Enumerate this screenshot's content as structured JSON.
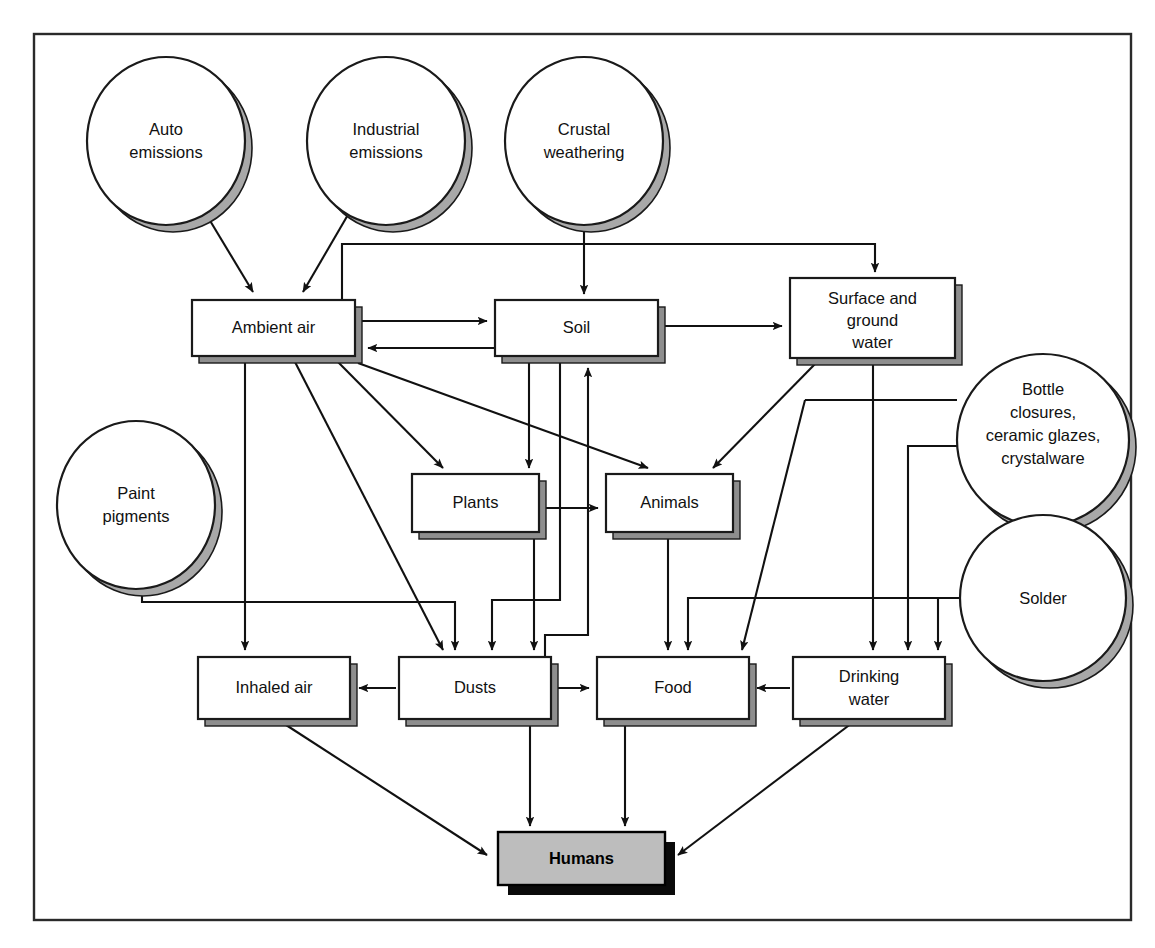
{
  "figure": {
    "frame": {
      "x": 33,
      "y": 33,
      "width": 1099,
      "height": 888
    }
  },
  "colors": {
    "line": "#111111",
    "box_fill": "#ffffff",
    "box_shadow": "#8e8e8e",
    "circle_shadow": "#a8a8a8",
    "humans_fill": "#bdbdbd",
    "humans_shadow": "#0a0a0a",
    "frame": "#2a2a2a"
  },
  "sources": [
    {
      "id": "auto-emissions",
      "lines": [
        "Auto",
        "emissions"
      ],
      "cx": 166,
      "cy": 141,
      "rx": 79,
      "ry": 84
    },
    {
      "id": "industrial-emissions",
      "lines": [
        "Industrial",
        "emissions"
      ],
      "cx": 386,
      "cy": 141,
      "rx": 79,
      "ry": 84
    },
    {
      "id": "crustal-weathering",
      "lines": [
        "Crustal",
        "weathering"
      ],
      "cx": 584,
      "cy": 141,
      "rx": 79,
      "ry": 84
    },
    {
      "id": "paint-pigments",
      "lines": [
        "Paint",
        "pigments"
      ],
      "cx": 136,
      "cy": 505,
      "rx": 79,
      "ry": 84
    },
    {
      "id": "bottle-closures",
      "lines": [
        "Bottle",
        "closures,",
        "ceramic glazes,",
        "crystalware"
      ],
      "cx": 1043,
      "cy": 440,
      "rx": 86,
      "ry": 86
    },
    {
      "id": "solder",
      "lines": [
        "Solder"
      ],
      "cx": 1043,
      "cy": 598,
      "rx": 83,
      "ry": 83
    }
  ],
  "compartments": [
    {
      "id": "ambient-air",
      "lines": [
        "Ambient air"
      ],
      "x": 192,
      "y": 300,
      "w": 163,
      "h": 56
    },
    {
      "id": "soil",
      "lines": [
        "Soil"
      ],
      "x": 495,
      "y": 300,
      "w": 163,
      "h": 56
    },
    {
      "id": "surface-ground-water",
      "lines": [
        "Surface and",
        "ground",
        "water"
      ],
      "x": 790,
      "y": 278,
      "w": 165,
      "h": 80
    },
    {
      "id": "plants",
      "lines": [
        "Plants"
      ],
      "x": 412,
      "y": 474,
      "w": 127,
      "h": 58
    },
    {
      "id": "animals",
      "lines": [
        "Animals"
      ],
      "x": 606,
      "y": 474,
      "w": 127,
      "h": 58
    },
    {
      "id": "inhaled-air",
      "lines": [
        "Inhaled air"
      ],
      "x": 198,
      "y": 657,
      "w": 152,
      "h": 62
    },
    {
      "id": "dusts",
      "lines": [
        "Dusts"
      ],
      "x": 399,
      "y": 657,
      "w": 152,
      "h": 62
    },
    {
      "id": "food",
      "lines": [
        "Food"
      ],
      "x": 597,
      "y": 657,
      "w": 152,
      "h": 62
    },
    {
      "id": "drinking-water",
      "lines": [
        "Drinking",
        "water"
      ],
      "x": 793,
      "y": 657,
      "w": 152,
      "h": 62
    }
  ],
  "target": {
    "id": "humans",
    "label": "Humans",
    "x": 498,
    "y": 832,
    "w": 167,
    "h": 53
  },
  "edges": [
    {
      "id": "auto-to-ambient-air",
      "from": "auto-emissions",
      "to": "ambient-air"
    },
    {
      "id": "industrial-to-ambient-air",
      "from": "industrial-emissions",
      "to": "ambient-air"
    },
    {
      "id": "crustal-to-soil",
      "from": "crustal-weathering",
      "to": "soil"
    },
    {
      "id": "ambient-air-to-soil",
      "from": "ambient-air",
      "to": "soil"
    },
    {
      "id": "soil-to-ambient-air",
      "from": "soil",
      "to": "ambient-air"
    },
    {
      "id": "ambient-air-to-surface-ground-water",
      "from": "ambient-air",
      "to": "surface-ground-water"
    },
    {
      "id": "soil-to-surface-ground-water",
      "from": "soil",
      "to": "surface-ground-water"
    },
    {
      "id": "ambient-air-to-plants",
      "from": "ambient-air",
      "to": "plants"
    },
    {
      "id": "ambient-air-to-animals",
      "from": "ambient-air",
      "to": "animals"
    },
    {
      "id": "ambient-air-to-dusts",
      "from": "ambient-air",
      "to": "dusts"
    },
    {
      "id": "ambient-air-to-inhaled-air",
      "from": "ambient-air",
      "to": "inhaled-air"
    },
    {
      "id": "soil-to-plants",
      "from": "soil",
      "to": "plants"
    },
    {
      "id": "soil-to-dusts",
      "from": "soil",
      "to": "dusts"
    },
    {
      "id": "plants-to-animals",
      "from": "plants",
      "to": "animals"
    },
    {
      "id": "plants-to-food",
      "from": "plants",
      "to": "food"
    },
    {
      "id": "animals-to-food",
      "from": "animals",
      "to": "food"
    },
    {
      "id": "animals-to-soil",
      "from": "animals",
      "to": "soil"
    },
    {
      "id": "surface-ground-water-to-animals",
      "from": "surface-ground-water",
      "to": "animals"
    },
    {
      "id": "surface-ground-water-to-food",
      "from": "surface-ground-water",
      "to": "food"
    },
    {
      "id": "surface-ground-water-to-drinking-water",
      "from": "surface-ground-water",
      "to": "drinking-water"
    },
    {
      "id": "bottle-closures-to-food",
      "from": "bottle-closures",
      "to": "food"
    },
    {
      "id": "bottle-closures-to-drinking-water",
      "from": "bottle-closures",
      "to": "drinking-water"
    },
    {
      "id": "solder-to-drinking-water",
      "from": "solder",
      "to": "drinking-water"
    },
    {
      "id": "paint-pigments-to-dusts",
      "from": "paint-pigments",
      "to": "dusts"
    },
    {
      "id": "dusts-to-inhaled-air",
      "from": "dusts",
      "to": "inhaled-air"
    },
    {
      "id": "dusts-to-food",
      "from": "dusts",
      "to": "food"
    },
    {
      "id": "drinking-water-to-food",
      "from": "drinking-water",
      "to": "food"
    },
    {
      "id": "dusts-to-soil",
      "from": "dusts",
      "to": "soil"
    },
    {
      "id": "inhaled-air-to-humans",
      "from": "inhaled-air",
      "to": "humans"
    },
    {
      "id": "dusts-to-humans",
      "from": "dusts",
      "to": "humans"
    },
    {
      "id": "food-to-humans",
      "from": "food",
      "to": "humans"
    },
    {
      "id": "drinking-water-to-humans",
      "from": "drinking-water",
      "to": "humans"
    }
  ]
}
